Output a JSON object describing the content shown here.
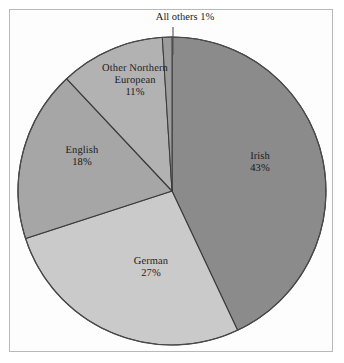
{
  "figure": {
    "background_color": "#ffffff",
    "frame_color": "#b9b9b9",
    "width": 344,
    "height": 363
  },
  "chart_data": {
    "type": "pie",
    "title": "",
    "subtitle": "",
    "xlabel": "",
    "ylabel": "",
    "legend_position": "none",
    "grid": false,
    "labels_inside_slices": true,
    "start_angle_deg": -90,
    "direction": "clockwise",
    "center": {
      "x": 172,
      "y": 191
    },
    "radius": 154,
    "categories": [
      "Irish",
      "German",
      "English",
      "Other Northern European",
      "All others"
    ],
    "values": [
      43,
      27,
      18,
      11,
      1
    ],
    "unit": "%",
    "slices": [
      {
        "name": "Irish",
        "value": 43,
        "value_label": "43%",
        "color": "#8b8b8b",
        "label_lines": [
          "Irish",
          "43%"
        ],
        "label_placement": "inside"
      },
      {
        "name": "German",
        "value": 27,
        "value_label": "27%",
        "color": "#cacaca",
        "label_lines": [
          "German",
          "27%"
        ],
        "label_placement": "inside"
      },
      {
        "name": "English",
        "value": 18,
        "value_label": "18%",
        "color": "#a6a6a6",
        "label_lines": [
          "English",
          "18%"
        ],
        "label_placement": "inside"
      },
      {
        "name": "Other Northern European",
        "value": 11,
        "value_label": "11%",
        "color": "#b2b2b2",
        "label_lines": [
          "Other Northern",
          "European",
          "11%"
        ],
        "label_placement": "inside"
      },
      {
        "name": "All others",
        "value": 1,
        "value_label": "1%",
        "color": "#9c9c9c",
        "label_lines": [
          "All others 1%"
        ],
        "label_placement": "outside-callout"
      }
    ],
    "slice_outline_color": "#3a3a3a",
    "callout_line_color": "#555555"
  },
  "labels": {
    "irish": {
      "name": "Irish",
      "value": "43%"
    },
    "german": {
      "name": "German",
      "value": "27%"
    },
    "english": {
      "name": "English",
      "value": "18%"
    },
    "other_northern": {
      "line1": "Other Northern",
      "line2": "European",
      "value": "11%"
    },
    "all_others": {
      "text": "All others 1%"
    }
  }
}
